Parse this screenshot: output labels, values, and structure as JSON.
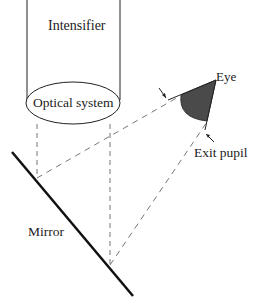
{
  "diagram": {
    "type": "optical-schematic",
    "labels": {
      "intensifier": "Intensifier",
      "optical_system": "Optical system",
      "eye": "Eye",
      "exit_pupil": "Exit pupil",
      "mirror": "Mirror"
    },
    "components": [
      {
        "name": "Intensifier",
        "shape": "tube",
        "x_left": 27,
        "x_right": 120,
        "y_top": 0,
        "y_bottom": 100
      },
      {
        "name": "Optical system",
        "shape": "ellipse",
        "cx": 73,
        "cy": 103,
        "rx": 47,
        "ry": 21
      },
      {
        "name": "Mirror",
        "shape": "line",
        "x1": 12,
        "y1": 152,
        "x2": 133,
        "y2": 296
      },
      {
        "name": "Eye",
        "shape": "quarter-disc",
        "apex": [
          216,
          80
        ]
      }
    ],
    "rays": [
      {
        "style": "dashed",
        "from": [
          37,
          124
        ],
        "to": [
          37,
          178
        ]
      },
      {
        "style": "dashed",
        "from": [
          110,
          124
        ],
        "to": [
          110,
          265
        ]
      },
      {
        "style": "dashed",
        "from": [
          37,
          178
        ],
        "to": [
          180,
          96
        ]
      },
      {
        "style": "dashed",
        "from": [
          110,
          265
        ],
        "to": [
          207,
          122
        ]
      }
    ],
    "colors": {
      "line": "#111111",
      "dashed": "#666666",
      "eye_fill": "#4a4a4a"
    }
  }
}
